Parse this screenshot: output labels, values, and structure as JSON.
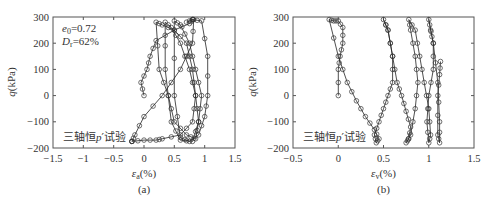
{
  "figure": {
    "panels": [
      {
        "id": "a",
        "caption": "(a)",
        "xlabel": "εa(%)",
        "xlabel_main": "ε",
        "xlabel_sub": "a",
        "xlabel_unit": "(%)",
        "ylabel": "q(kPa)",
        "ylabel_main": "q",
        "ylabel_unit": "(kPa)",
        "xticks": [
          "−1.5",
          "−1",
          "−0.5",
          "0",
          "0.5",
          "1",
          "1.5"
        ],
        "yticks": [
          "300",
          "200",
          "100",
          "0",
          "−100",
          "−200"
        ],
        "annotation_e0": "e0=0.72",
        "annotation_e0_main": "e",
        "annotation_e0_sub": "0",
        "annotation_e0_val": "=0.72",
        "annotation_dr_main": "D",
        "annotation_dr_sub": "r",
        "annotation_dr_val": "=62%",
        "test_label_pre": "三轴恒",
        "test_label_p": "p",
        "test_label_post": "′试验"
      },
      {
        "id": "b",
        "caption": "(b)",
        "xlabel": "εv(%)",
        "xlabel_main": "ε",
        "xlabel_sub": "v",
        "xlabel_unit": "(%)",
        "ylabel": "q(kPa)",
        "ylabel_main": "q",
        "ylabel_unit": "(kPa)",
        "xticks": [
          "−0.5",
          "0",
          "0.5",
          "1",
          "1.5"
        ],
        "yticks": [
          "300",
          "200",
          "100",
          "0",
          "−100",
          "−200"
        ],
        "test_label_pre": "三轴恒",
        "test_label_p": "p",
        "test_label_post": "′试验"
      }
    ]
  },
  "chart_data": [
    {
      "type": "line",
      "title": "(a)",
      "xlabel": "εa(%)",
      "ylabel": "q(kPa)",
      "xlim": [
        -1.5,
        1.5
      ],
      "ylim": [
        -200,
        300
      ],
      "grid": false,
      "marker": "circle-open",
      "annotations": [
        "e0=0.72",
        "Dr=62%",
        "三轴恒p′试验"
      ],
      "series": [
        {
          "name": "cyclic stress-strain loops",
          "x": [
            0.0,
            -0.05,
            0.05,
            0.1,
            0.2,
            0.5,
            0.75,
            0.8,
            0.82,
            0.8,
            0.6,
            0.3,
            0.0,
            -0.15,
            -0.2,
            -0.2,
            0.0,
            0.2,
            0.3,
            0.6,
            0.8,
            0.85,
            0.8,
            0.7,
            0.5,
            0.3,
            0.2,
            0.25,
            0.4,
            0.5,
            0.7,
            0.85,
            0.9,
            0.85,
            0.75,
            0.6,
            0.45,
            0.35,
            0.35,
            0.45,
            0.6,
            0.8,
            0.9,
            0.95,
            0.85,
            0.75,
            0.6,
            0.5,
            0.5,
            0.6,
            0.75,
            0.9,
            1.0,
            1.05,
            1.05,
            0.95,
            0.8,
            0.7
          ],
          "y": [
            0,
            50,
            100,
            150,
            210,
            250,
            275,
            290,
            290,
            200,
            100,
            0,
            -80,
            -150,
            -175,
            -175,
            -170,
            -170,
            -165,
            -150,
            -100,
            0,
            100,
            200,
            250,
            270,
            280,
            100,
            0,
            -100,
            -150,
            -165,
            -100,
            0,
            100,
            200,
            260,
            280,
            100,
            -100,
            -170,
            -175,
            -100,
            0,
            100,
            200,
            270,
            285,
            0,
            -160,
            -175,
            -150,
            -80,
            0,
            150,
            285,
            290,
            280
          ]
        }
      ]
    },
    {
      "type": "line",
      "title": "(b)",
      "xlabel": "εv(%)",
      "ylabel": "q(kPa)",
      "xlim": [
        -0.5,
        1.5
      ],
      "ylim": [
        -200,
        300
      ],
      "grid": false,
      "marker": "circle-open",
      "annotations": [
        "三轴恒p′试验"
      ],
      "series": [
        {
          "name": "volumetric strain loops",
          "x": [
            0.0,
            0.0,
            0.02,
            0.05,
            0.05,
            0.0,
            -0.05,
            -0.1,
            0.0,
            0.1,
            0.2,
            0.3,
            0.4,
            0.45,
            0.42,
            0.4,
            0.45,
            0.5,
            0.55,
            0.6,
            0.6,
            0.55,
            0.5,
            0.55,
            0.6,
            0.65,
            0.7,
            0.75,
            0.8,
            0.78,
            0.75,
            0.8,
            0.85,
            0.88,
            0.85,
            0.8,
            0.78,
            0.85,
            0.9,
            0.95,
            1.0,
            1.02,
            1.0,
            0.98,
            1.0,
            1.05,
            1.05,
            1.02,
            1.0,
            1.05,
            1.1,
            1.12,
            1.12,
            1.1,
            1.1,
            1.12,
            1.13
          ],
          "y": [
            0,
            100,
            150,
            200,
            260,
            285,
            285,
            290,
            150,
            50,
            -20,
            -80,
            -130,
            -165,
            -180,
            -150,
            -100,
            -50,
            0,
            50,
            150,
            250,
            290,
            250,
            150,
            50,
            0,
            -60,
            -120,
            -165,
            -180,
            -150,
            -50,
            50,
            150,
            250,
            290,
            250,
            150,
            50,
            -50,
            -150,
            -180,
            -100,
            0,
            100,
            200,
            250,
            290,
            200,
            50,
            -100,
            -180,
            -150,
            0,
            80,
            130
          ]
        }
      ]
    }
  ]
}
